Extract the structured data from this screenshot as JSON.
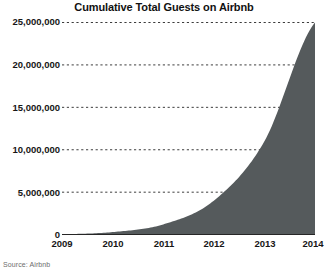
{
  "chart_data": {
    "type": "area",
    "title": "Cumulative Total Guests on Airbnb",
    "xlabel": "",
    "ylabel": "",
    "x": [
      2009,
      2010,
      2011,
      2012,
      2013,
      2014
    ],
    "categories": [
      "2009",
      "2010",
      "2011",
      "2012",
      "2013",
      "2014"
    ],
    "values": [
      50000,
      300000,
      1200000,
      4000000,
      11000000,
      25000000
    ],
    "series": [
      {
        "name": "Cumulative Total Guests",
        "values": [
          50000,
          300000,
          1200000,
          4000000,
          11000000,
          25000000
        ]
      }
    ],
    "xlim": [
      2009,
      2014
    ],
    "ylim": [
      0,
      25000000
    ],
    "ytick_values": [
      0,
      5000000,
      10000000,
      15000000,
      20000000,
      25000000
    ],
    "ytick_labels": [
      "0",
      "5,000,000",
      "10,000,000",
      "15,000,000",
      "20,000,000",
      "25,000,000"
    ],
    "xtick_labels": [
      "2009",
      "2010",
      "2011",
      "2012",
      "2013",
      "2014"
    ],
    "grid": "horizontal-dotted",
    "legend": "none",
    "area_color": "#555a5c",
    "gridline_color": "#3d3d3d",
    "axis_color": "#262626",
    "source": "Source: Airbnb"
  }
}
